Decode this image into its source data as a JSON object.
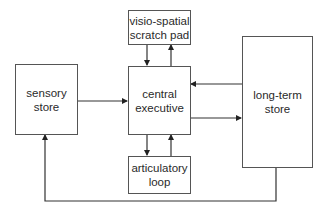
{
  "diagram": {
    "nodes": [
      {
        "id": "visio_spatial",
        "label": "visio-spatial scratch pad",
        "lines": [
          "visio-spatial",
          "scratch pad"
        ]
      },
      {
        "id": "sensory",
        "label": "sensory store",
        "lines": [
          "sensory",
          "store"
        ]
      },
      {
        "id": "central",
        "label": "central executive",
        "lines": [
          "central",
          "executive"
        ]
      },
      {
        "id": "longterm",
        "label": "long-term store",
        "lines": [
          "long-term",
          "store"
        ]
      },
      {
        "id": "articulatory",
        "label": "articulatory loop",
        "lines": [
          "articulatory",
          "loop"
        ]
      }
    ],
    "edges": [
      {
        "from": "sensory",
        "to": "central"
      },
      {
        "from": "central",
        "to": "visio_spatial"
      },
      {
        "from": "visio_spatial",
        "to": "central"
      },
      {
        "from": "central",
        "to": "articulatory"
      },
      {
        "from": "articulatory",
        "to": "central"
      },
      {
        "from": "central",
        "to": "longterm"
      },
      {
        "from": "longterm",
        "to": "central"
      },
      {
        "from": "longterm",
        "to": "sensory"
      }
    ]
  }
}
